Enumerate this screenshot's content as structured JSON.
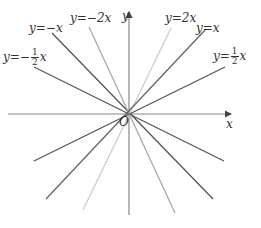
{
  "axes": {
    "x_label": "x",
    "y_label": "y",
    "origin_label": "O",
    "color": "#777777"
  },
  "lines": [
    {
      "name": "y=-1/2x",
      "prefix": "y=−",
      "frac": {
        "num": "1",
        "den": "2"
      },
      "suffix": "x",
      "color": "#555555",
      "x1": 34,
      "y1": 67,
      "x2": 224,
      "y2": 161
    },
    {
      "name": "y=-x",
      "text": "y=−x",
      "color": "#555555",
      "x1": 52,
      "y1": 33,
      "x2": 213,
      "y2": 199
    },
    {
      "name": "y=-2x",
      "text": "y=−2x",
      "color": "#aaaaaa",
      "x1": 89,
      "y1": 27,
      "x2": 175,
      "y2": 213
    },
    {
      "name": "y=2x",
      "text": "y=2x",
      "color": "#cccccc",
      "x1": 171,
      "y1": 28,
      "x2": 83,
      "y2": 210
    },
    {
      "name": "y=x",
      "text": "y=x",
      "color": "#666666",
      "x1": 206,
      "y1": 29,
      "x2": 46,
      "y2": 199
    },
    {
      "name": "y=1/2x",
      "prefix": "y=",
      "frac": {
        "num": "1",
        "den": "2"
      },
      "suffix": "x",
      "color": "#555555",
      "x1": 225,
      "y1": 67,
      "x2": 34,
      "y2": 161
    }
  ]
}
